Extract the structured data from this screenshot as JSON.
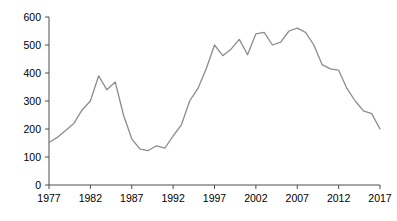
{
  "chart_data": {
    "type": "line",
    "title": "",
    "subtitle": "",
    "xlabel": "",
    "ylabel": "",
    "xlim": [
      1977,
      2017
    ],
    "ylim": [
      0,
      600
    ],
    "grid": false,
    "legend": null,
    "legend_position": "none",
    "line_color": "#8c8c8c",
    "axis_color": "#4d4d4d",
    "x_tick_labels": [
      "1977",
      "1982",
      "1987",
      "1992",
      "1997",
      "2002",
      "2007",
      "2012",
      "2017"
    ],
    "x_ticks": [
      1977,
      1982,
      1987,
      1992,
      1997,
      2002,
      2007,
      2012,
      2017
    ],
    "y_tick_labels": [
      "0",
      "100",
      "200",
      "300",
      "400",
      "500",
      "600"
    ],
    "y_ticks": [
      0,
      100,
      200,
      300,
      400,
      500,
      600
    ],
    "x": [
      1977,
      1978,
      1979,
      1980,
      1981,
      1982,
      1983,
      1984,
      1985,
      1986,
      1987,
      1988,
      1989,
      1990,
      1991,
      1992,
      1993,
      1994,
      1995,
      1996,
      1997,
      1998,
      1999,
      2000,
      2001,
      2002,
      2003,
      2004,
      2005,
      2006,
      2007,
      2008,
      2009,
      2010,
      2011,
      2012,
      2013,
      2014,
      2015,
      2016,
      2017
    ],
    "values": [
      152,
      170,
      195,
      220,
      268,
      300,
      390,
      340,
      368,
      250,
      165,
      128,
      123,
      140,
      132,
      175,
      215,
      300,
      345,
      415,
      500,
      462,
      485,
      520,
      465,
      540,
      545,
      500,
      510,
      550,
      560,
      545,
      500,
      430,
      415,
      410,
      345,
      300,
      265,
      255,
      200
    ],
    "series": [
      {
        "name": "series-1",
        "color": "#8c8c8c",
        "values": [
          152,
          170,
          195,
          220,
          268,
          300,
          390,
          340,
          368,
          250,
          165,
          128,
          123,
          140,
          132,
          175,
          215,
          300,
          345,
          415,
          500,
          462,
          485,
          520,
          465,
          540,
          545,
          500,
          510,
          550,
          560,
          545,
          500,
          430,
          415,
          410,
          345,
          300,
          265,
          255,
          200
        ]
      }
    ]
  }
}
